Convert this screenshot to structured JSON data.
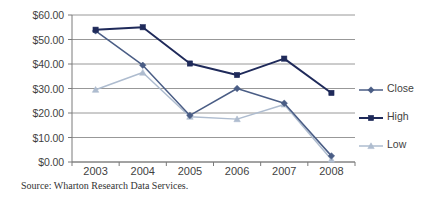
{
  "chart_data": {
    "type": "line",
    "title": "",
    "xlabel": "",
    "ylabel": "",
    "x": [
      "2003",
      "2004",
      "2005",
      "2006",
      "2007",
      "2008"
    ],
    "categories": [
      "2003",
      "2004",
      "2005",
      "2006",
      "2007",
      "2008"
    ],
    "series": [
      {
        "name": "Close",
        "color": "#4a5d85",
        "marker": "diamond",
        "values": [
          53.5,
          39.5,
          19.0,
          30.0,
          24.0,
          2.5
        ]
      },
      {
        "name": "High",
        "color": "#1f2a5a",
        "marker": "square",
        "values": [
          54.0,
          55.0,
          40.2,
          35.5,
          42.2,
          28.2
        ]
      },
      {
        "name": "Low",
        "color": "#aebccf",
        "marker": "triangle",
        "values": [
          29.5,
          36.5,
          18.5,
          17.5,
          23.5,
          1.0
        ]
      }
    ],
    "ylim": [
      0,
      60
    ],
    "y_ticks": [
      0,
      10,
      20,
      30,
      40,
      50,
      60
    ],
    "y_tick_labels": [
      "$0.00",
      "$10.00",
      "$20.00",
      "$30.00",
      "$40.00",
      "$50.00",
      "$60.00"
    ],
    "grid": true,
    "grid_axis": "y",
    "legend_position": "right",
    "gridline_color": "#8c8c8c",
    "axis_color": "#7a7a7a"
  },
  "legend": {
    "entries": [
      {
        "label": "Close"
      },
      {
        "label": "High"
      },
      {
        "label": "Low"
      }
    ]
  },
  "source": {
    "text": "Source: Wharton Research Data Services."
  }
}
